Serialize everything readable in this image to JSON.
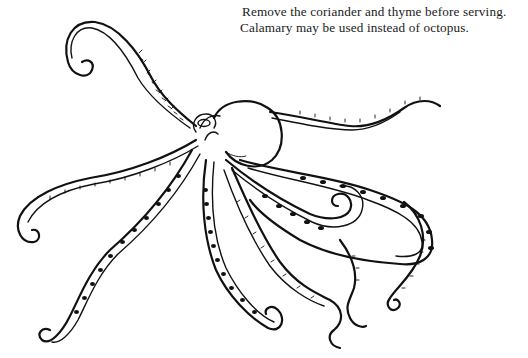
{
  "page": {
    "caption": {
      "lines": [
        "Remove the coriander and thyme before serving.",
        "Calamary may be used instead of octopus."
      ]
    },
    "illustration": {
      "subject": "octopus-line-drawing",
      "style": "black ink on white"
    }
  }
}
